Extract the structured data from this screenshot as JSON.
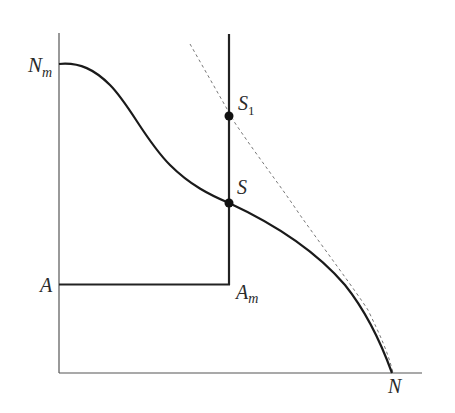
{
  "diagram": {
    "type": "production-possibility-frontier",
    "colors": {
      "axis": "#555555",
      "curve": "#1a1a1a",
      "dashed": "#777777",
      "point": "#111111",
      "background": "#ffffff"
    },
    "labels": {
      "n_m": {
        "main": "N",
        "sub": "m"
      },
      "a": {
        "main": "A"
      },
      "a_m": {
        "main": "A",
        "sub": "m"
      },
      "n": {
        "main": "N"
      },
      "s": {
        "main": "S"
      },
      "s1": {
        "main": "S",
        "sub": "1"
      }
    },
    "points": [
      {
        "name": "S1",
        "x": 229,
        "y": 116
      },
      {
        "name": "S",
        "x": 229,
        "y": 203
      }
    ]
  }
}
